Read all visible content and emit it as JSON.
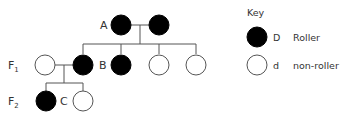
{
  "diagram": {
    "type": "pedigree",
    "generation_labels": [
      {
        "id": "F1",
        "base": "F",
        "sub": "1"
      },
      {
        "id": "F2",
        "base": "F",
        "sub": "2"
      }
    ],
    "individual_labels": {
      "A": "A",
      "B": "B",
      "C": "C"
    },
    "colors": {
      "affected": "#000000",
      "unaffected": "#ffffff",
      "line": "#555555",
      "text": "#333333"
    },
    "generations": [
      {
        "name": "P",
        "individuals": [
          {
            "label": "A",
            "phenotype": "roller"
          },
          {
            "label": "",
            "phenotype": "roller"
          }
        ]
      },
      {
        "name": "F1",
        "individuals": [
          {
            "label": "",
            "phenotype": "non-roller",
            "note": "mate"
          },
          {
            "label": "",
            "phenotype": "roller"
          },
          {
            "label": "B",
            "phenotype": "roller"
          },
          {
            "label": "",
            "phenotype": "non-roller"
          },
          {
            "label": "",
            "phenotype": "non-roller"
          }
        ]
      },
      {
        "name": "F2",
        "individuals": [
          {
            "label": "",
            "phenotype": "roller"
          },
          {
            "label": "C",
            "phenotype": "non-roller"
          }
        ]
      }
    ]
  },
  "key": {
    "title": "Key",
    "items": [
      {
        "symbol": "filled-circle",
        "allele": "D",
        "meaning": "Roller"
      },
      {
        "symbol": "empty-circle",
        "allele": "d",
        "meaning": "non-roller"
      }
    ]
  }
}
